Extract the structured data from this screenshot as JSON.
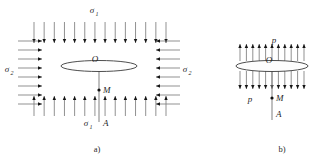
{
  "figure": {
    "background_color": "#ffffff",
    "ink_color": "#1f1f1f"
  },
  "panels": [
    {
      "id": "a",
      "caption": "a)",
      "center_label": "O",
      "point_labels": [
        "M",
        "A"
      ],
      "stress_labels": {
        "top": "σ",
        "top_sub": "1",
        "bottom": "σ",
        "bottom_sub": "1",
        "left": "σ",
        "left_sub": "2",
        "right": "σ",
        "right_sub": "2"
      },
      "arrow_counts": {
        "top": 14,
        "bottom": 14,
        "left": 8,
        "right": 8
      },
      "arrow_directions": {
        "top": "down",
        "bottom": "up",
        "left": "right",
        "right": "left"
      },
      "plate": {
        "cx": 99,
        "cy": 66,
        "rx": 38,
        "ry": 5.5
      }
    },
    {
      "id": "b",
      "caption": "b)",
      "center_label": "O",
      "point_labels": [
        "M",
        "A"
      ],
      "stress_labels": {
        "top": "p",
        "bottom": "p"
      },
      "arrow_counts": {
        "top": 11,
        "bottom": 11
      },
      "arrow_directions": {
        "top": "up",
        "bottom": "down"
      },
      "plate": {
        "cx": 272,
        "cy": 66,
        "rx": 36,
        "ry": 5.5
      }
    }
  ]
}
